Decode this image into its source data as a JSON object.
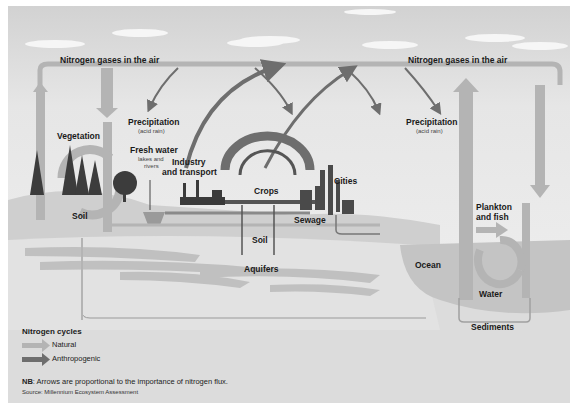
{
  "diagram": {
    "labels": {
      "air_left": "Nitrogen gases in the air",
      "air_right": "Nitrogen gases in the air",
      "vegetation": "Vegetation",
      "soil_left": "Soil",
      "precipitation_left": "Precipitation",
      "precipitation_left_sub": "(acid rain)",
      "precipitation_right": "Precipitation",
      "precipitation_right_sub": "(acid rain)",
      "fresh_water": "Fresh water",
      "fresh_water_sub1": "lakes and",
      "fresh_water_sub2": "rivers",
      "industry": "Industry",
      "industry2": "and transport",
      "crops": "Crops",
      "cities": "Cities",
      "sewage": "Sewage",
      "soil_center": "Soil",
      "aquifers": "Aquifers",
      "plankton": "Plankton",
      "plankton2": "and fish",
      "ocean": "Ocean",
      "water": "Water",
      "sediments": "Sediments"
    },
    "colors": {
      "natural_arrow": "#b4b4b4",
      "anthropogenic_arrow": "#6e6e6e",
      "background": "#dcdcdc",
      "ocean": "#c4c4c4"
    }
  },
  "legend": {
    "title": "Nitrogen cycles",
    "items": [
      {
        "label": "Natural",
        "color": "#b4b4b4"
      },
      {
        "label": "Anthropogenic",
        "color": "#6e6e6e"
      }
    ]
  },
  "note": {
    "prefix": "NB",
    "text": ": Arrows are proportional to the importance of nitrogen flux."
  },
  "source": "Source: Millennium Ecosystem Assessment"
}
